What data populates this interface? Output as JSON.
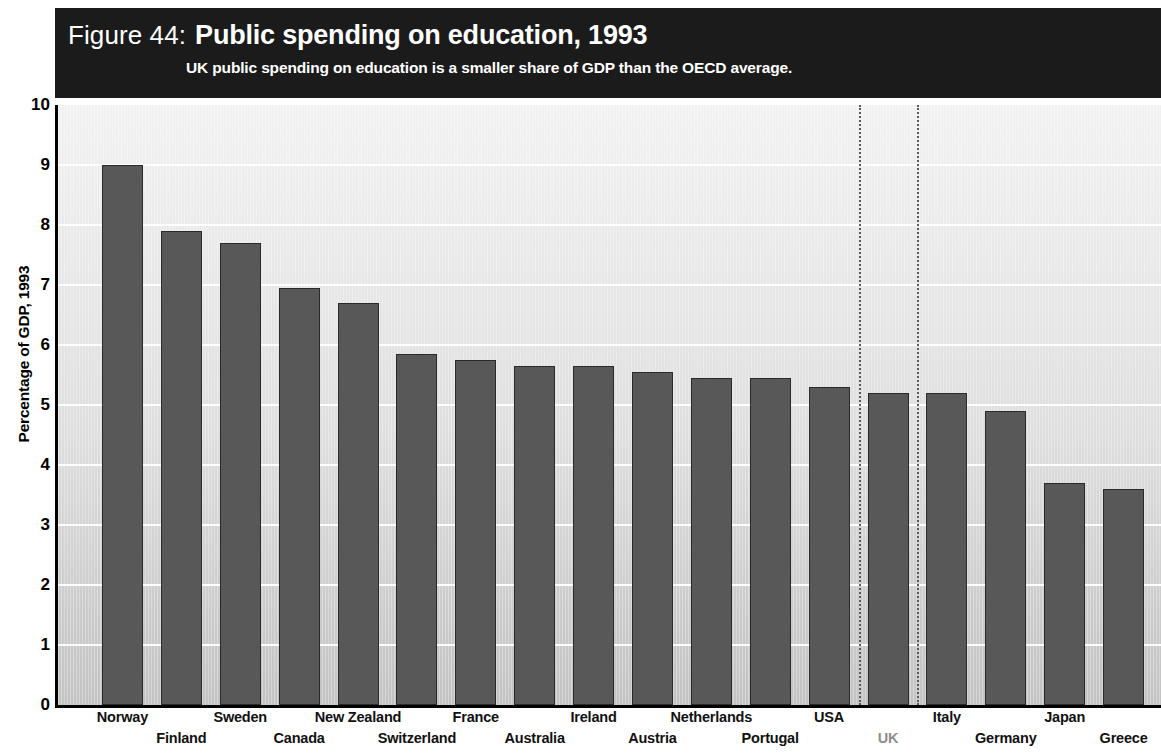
{
  "header": {
    "figure_number": "Figure 44:",
    "title": "Public spending on education, 1993",
    "subtitle": "UK public spending on education is a smaller share of GDP than the OECD average."
  },
  "chart_data": {
    "type": "bar",
    "title": "Public spending on education, 1993",
    "subtitle": "UK public spending on education is a smaller share of GDP than the OECD average.",
    "xlabel": "",
    "ylabel": "Percentage of GDP, 1993",
    "ylim": [
      0,
      10
    ],
    "ytick_labels": [
      "0",
      "1",
      "2",
      "3",
      "4",
      "5",
      "6",
      "7",
      "8",
      "9",
      "10"
    ],
    "ytick_values": [
      0,
      1,
      2,
      3,
      4,
      5,
      6,
      7,
      8,
      9,
      10
    ],
    "grid": true,
    "legend": "none",
    "bar_color": "#585858",
    "highlight_country": "UK",
    "highlight_color": "#8d8d8d",
    "annotations": [
      "dotted vertical marker line left of UK bar",
      "dotted vertical marker line right of UK bar"
    ],
    "categories": [
      "Norway",
      "Finland",
      "Sweden",
      "Canada",
      "New Zealand",
      "Switzerland",
      "France",
      "Australia",
      "Ireland",
      "Austria",
      "Netherlands",
      "Portugal",
      "USA",
      "UK",
      "Italy",
      "Germany",
      "Japan",
      "Greece"
    ],
    "values": [
      9.0,
      7.9,
      7.7,
      6.95,
      6.7,
      5.85,
      5.75,
      5.65,
      5.65,
      5.55,
      5.45,
      5.45,
      5.3,
      5.2,
      5.2,
      4.9,
      3.7,
      3.6
    ]
  }
}
